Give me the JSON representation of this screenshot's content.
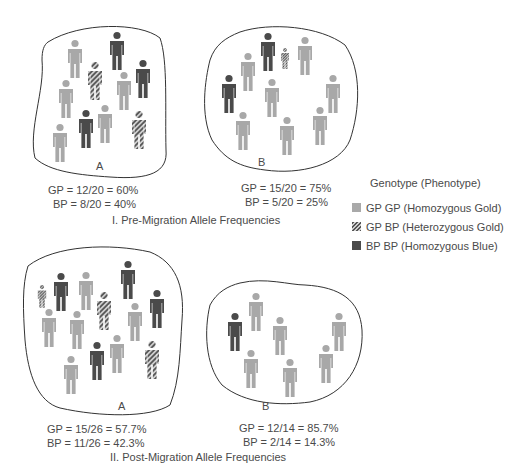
{
  "colors": {
    "gold": "#a8a8a8",
    "blue": "#4a4a4a",
    "hatch_dark": "#555555",
    "hatch_light": "#d0d0d0",
    "outline": "#333333"
  },
  "section_pre": {
    "title": "I. Pre-Migration Allele Frequencies",
    "population_a": {
      "label": "A",
      "gp": "GP = 12/20 = 60%",
      "bp": "BP = 8/20 = 40%"
    },
    "population_b": {
      "label": "B",
      "gp": "GP = 15/20 = 75%",
      "bp": "BP = 5/20 = 25%"
    }
  },
  "section_post": {
    "title": "II. Post-Migration Allele Frequencies",
    "population_a": {
      "label": "A",
      "gp": "GP = 15/26 = 57.7%",
      "bp": "BP = 11/26 = 42.3%"
    },
    "population_b": {
      "label": "B",
      "gp": "GP = 12/14 = 85.7%",
      "bp": "BP = 2/14 = 14.3%"
    }
  },
  "legend": {
    "title": "Genotype (Phenotype)",
    "items": [
      {
        "swatch": "gold",
        "label": "GP GP (Homozygous Gold)"
      },
      {
        "swatch": "hatched",
        "label": "GP BP (Heterozygous Gold)"
      },
      {
        "swatch": "dark",
        "label": "BP BP (Homozygous Blue)"
      }
    ]
  },
  "figures": {
    "pre_a": [
      {
        "x": 75,
        "y": 40,
        "s": 1,
        "t": "gold"
      },
      {
        "x": 117,
        "y": 32,
        "s": 1,
        "t": "dark"
      },
      {
        "x": 95,
        "y": 62,
        "s": 1,
        "t": "het"
      },
      {
        "x": 143,
        "y": 60,
        "s": 1,
        "t": "dark"
      },
      {
        "x": 124,
        "y": 72,
        "s": 1,
        "t": "gold"
      },
      {
        "x": 66,
        "y": 80,
        "s": 1,
        "t": "gold"
      },
      {
        "x": 86,
        "y": 110,
        "s": 1,
        "t": "dark"
      },
      {
        "x": 105,
        "y": 105,
        "s": 1,
        "t": "gold"
      },
      {
        "x": 139,
        "y": 111,
        "s": 1,
        "t": "het"
      },
      {
        "x": 60,
        "y": 124,
        "s": 1,
        "t": "gold"
      }
    ],
    "pre_b": [
      {
        "x": 268,
        "y": 33,
        "s": 1,
        "t": "dark"
      },
      {
        "x": 285,
        "y": 48,
        "s": 0.55,
        "t": "het"
      },
      {
        "x": 305,
        "y": 37,
        "s": 1,
        "t": "gold"
      },
      {
        "x": 248,
        "y": 53,
        "s": 1,
        "t": "gold"
      },
      {
        "x": 229,
        "y": 75,
        "s": 1,
        "t": "dark"
      },
      {
        "x": 272,
        "y": 79,
        "s": 1,
        "t": "gold"
      },
      {
        "x": 333,
        "y": 75,
        "s": 1,
        "t": "gold"
      },
      {
        "x": 243,
        "y": 112,
        "s": 1,
        "t": "gold"
      },
      {
        "x": 287,
        "y": 117,
        "s": 1,
        "t": "gold"
      },
      {
        "x": 320,
        "y": 107,
        "s": 1,
        "t": "gold"
      }
    ],
    "post_a": [
      {
        "x": 42,
        "y": 285,
        "s": 0.6,
        "t": "het"
      },
      {
        "x": 61,
        "y": 273,
        "s": 1,
        "t": "dark"
      },
      {
        "x": 86,
        "y": 272,
        "s": 1,
        "t": "gold"
      },
      {
        "x": 128,
        "y": 261,
        "s": 1,
        "t": "dark"
      },
      {
        "x": 104,
        "y": 292,
        "s": 1,
        "t": "het"
      },
      {
        "x": 49,
        "y": 309,
        "s": 1,
        "t": "gold"
      },
      {
        "x": 77,
        "y": 311,
        "s": 1,
        "t": "gold"
      },
      {
        "x": 135,
        "y": 303,
        "s": 1,
        "t": "gold"
      },
      {
        "x": 157,
        "y": 290,
        "s": 1,
        "t": "dark"
      },
      {
        "x": 97,
        "y": 342,
        "s": 1,
        "t": "dark"
      },
      {
        "x": 117,
        "y": 335,
        "s": 1,
        "t": "gold"
      },
      {
        "x": 152,
        "y": 341,
        "s": 1,
        "t": "het"
      },
      {
        "x": 71,
        "y": 356,
        "s": 1,
        "t": "gold"
      }
    ],
    "post_b": [
      {
        "x": 256,
        "y": 293,
        "s": 1,
        "t": "gold"
      },
      {
        "x": 235,
        "y": 313,
        "s": 1,
        "t": "dark"
      },
      {
        "x": 280,
        "y": 317,
        "s": 1,
        "t": "gold"
      },
      {
        "x": 339,
        "y": 313,
        "s": 1,
        "t": "gold"
      },
      {
        "x": 251,
        "y": 350,
        "s": 1,
        "t": "gold"
      },
      {
        "x": 290,
        "y": 359,
        "s": 1,
        "t": "gold"
      },
      {
        "x": 326,
        "y": 345,
        "s": 1,
        "t": "gold"
      }
    ]
  }
}
